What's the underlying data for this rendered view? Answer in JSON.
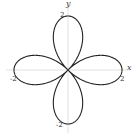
{
  "chart_data": {
    "type": "line",
    "title": "",
    "equation": "r = 2cos(2θ)",
    "xlabel": "x",
    "ylabel": "y",
    "xlim": [
      -2,
      2
    ],
    "ylim": [
      -2,
      2
    ],
    "grid": false,
    "tick_labels": {
      "top": "2",
      "right": "2",
      "left": "-2",
      "bottom": "-2"
    },
    "series": [
      {
        "name": "rose",
        "petals": 4,
        "amplitude": 2,
        "color": "#222222"
      }
    ]
  },
  "labels": {
    "x_axis": "x",
    "y_axis": "y",
    "top_tick": "2",
    "right_tick": "2",
    "left_tick": "-2",
    "bottom_tick": "-2"
  }
}
